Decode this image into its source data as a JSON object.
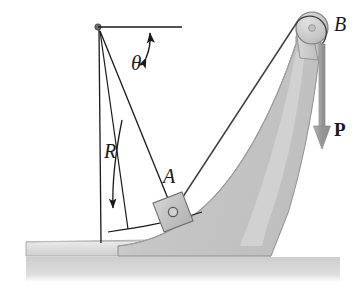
{
  "figure": {
    "kind": "statics-free-body-diagram",
    "canvas": {
      "width": 362,
      "height": 293
    },
    "background_color": "#ffffff"
  },
  "labels": {
    "theta": "θ",
    "radius": "R",
    "block": "A",
    "pulley": "B",
    "force": "P"
  },
  "colors": {
    "line": "#1a1a1a",
    "wedge_fill": "#c9c9c9",
    "wedge_edge": "#8a8a8a",
    "block_fill": "#c4c4c4",
    "block_edge": "#6e6e6e",
    "pulley_fill": "#c9c9c9",
    "pulley_edge": "#7d7d7d",
    "ground_fill": "#d8d8d8",
    "ground_edge": "#9a9a9a",
    "shadow_fill": "#d0d0d0",
    "arrow_fill": "#9a9a9a",
    "cable": "#3a3a3a"
  },
  "geometry": {
    "pivot": {
      "x": 98,
      "y": 27,
      "radius": 3
    },
    "horizontal_reference": {
      "x1": 98,
      "y1": 27,
      "x2": 182,
      "y2": 27
    },
    "vertical_reference": {
      "x1": 99,
      "y1": 30,
      "x2": 101,
      "y2": 243
    },
    "slot_arc_line": {
      "x1": 100,
      "y1": 31,
      "x2": 128,
      "y2": 229
    },
    "radius_line": {
      "x1": 100,
      "y1": 31,
      "x2": 173,
      "y2": 212
    },
    "theta_arc": {
      "cx": 98,
      "cy": 27,
      "r": 52,
      "start_deg": 0,
      "end_deg": 68,
      "double_headed": true
    },
    "radius_dim_arrow": {
      "x1": 120,
      "y1": 122,
      "x2": 112,
      "y2": 212
    },
    "slot_groove_arc": {
      "x1": 110,
      "y1": 231,
      "x2": 205,
      "y2": 215
    },
    "block": {
      "cx": 173,
      "cy": 212,
      "size": 31,
      "rotation_deg": -21,
      "pin_radius": 5
    },
    "pulley": {
      "cx": 312,
      "cy": 28,
      "radius": 16,
      "hub_radius": 4
    },
    "cable": {
      "from_x": 173,
      "from_y": 212,
      "to_x": 297,
      "to_y": 22
    },
    "force_arrow": {
      "x": 322,
      "y_top": 45,
      "y_tip": 148,
      "shaft_width": 6,
      "head_width": 17,
      "head_height": 22
    },
    "ground_slab": {
      "x_left": 26,
      "x_right": 271,
      "y_top": 241,
      "y_bottom": 257
    },
    "ground_shadow": {
      "x_left": 26,
      "x_right": 340,
      "y_top": 257,
      "y_bottom": 281
    }
  }
}
